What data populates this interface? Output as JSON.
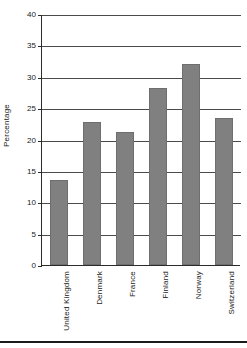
{
  "chart_data": {
    "type": "bar",
    "title": "",
    "xlabel": "",
    "ylabel": "Percentage",
    "categories": [
      "United Kingdom",
      "Denmark",
      "France",
      "Finland",
      "Norway",
      "Switzerland"
    ],
    "values": [
      13.5,
      22.8,
      21.2,
      28.2,
      32.0,
      23.5
    ],
    "ylim": [
      0,
      40
    ],
    "ytick_labels": [
      "0",
      "5",
      "10",
      "15",
      "20",
      "25",
      "30",
      "35",
      "40"
    ],
    "ytick_values": [
      0,
      5,
      10,
      15,
      20,
      25,
      30,
      35,
      40
    ],
    "grid": true,
    "legend": "none",
    "bar_color": "#808080",
    "axis_color": "#2b2b2b",
    "grid_color": "#4a4a4a"
  }
}
